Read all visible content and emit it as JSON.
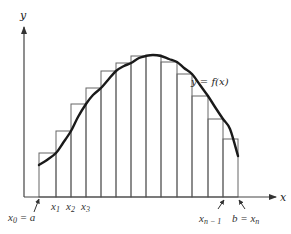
{
  "diagram": {
    "colors": {
      "background": "#ffffff",
      "line": "#555555",
      "curve": "#1a1a1a",
      "text": "#333333"
    },
    "axes": {
      "y_label": "y",
      "x_label": "x"
    },
    "curve_label": "y = f(x)",
    "partition_points": [
      39,
      56,
      71,
      86,
      101,
      116,
      131,
      146,
      161,
      177,
      192,
      208,
      223,
      238
    ],
    "rect_tops": [
      153,
      131,
      104,
      88,
      71,
      63,
      56,
      55,
      62,
      74,
      96,
      119,
      139
    ],
    "curve_points": [
      [
        39,
        165
      ],
      [
        47,
        160
      ],
      [
        56,
        153
      ],
      [
        63,
        143
      ],
      [
        71,
        131
      ],
      [
        78,
        117
      ],
      [
        86,
        104
      ],
      [
        93,
        95
      ],
      [
        101,
        88
      ],
      [
        108,
        80
      ],
      [
        116,
        71
      ],
      [
        124,
        66
      ],
      [
        131,
        63
      ],
      [
        139,
        58
      ],
      [
        146,
        56
      ],
      [
        153,
        55
      ],
      [
        161,
        56
      ],
      [
        169,
        59
      ],
      [
        177,
        62
      ],
      [
        184,
        68
      ],
      [
        192,
        74
      ],
      [
        200,
        85
      ],
      [
        208,
        96
      ],
      [
        215,
        107
      ],
      [
        223,
        119
      ],
      [
        230,
        129
      ],
      [
        238,
        156
      ]
    ],
    "tick_labels": {
      "x0": {
        "main": "x",
        "sub": "0",
        "suffix": " = a"
      },
      "x1": {
        "main": "x",
        "sub": "1"
      },
      "x2": {
        "main": "x",
        "sub": "2"
      },
      "x3": {
        "main": "x",
        "sub": "3"
      },
      "xn_minus_1": {
        "main": "x",
        "sub": "n − 1"
      },
      "b_eq_xn": {
        "prefix": "b = ",
        "main": "x",
        "sub": "n"
      }
    }
  }
}
